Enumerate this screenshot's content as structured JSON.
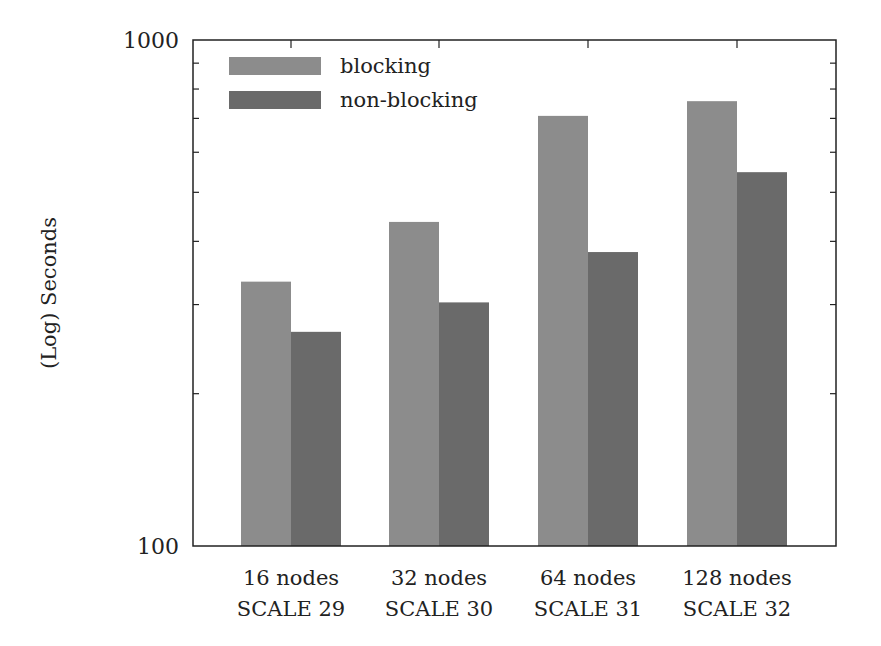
{
  "chart_data": {
    "type": "bar",
    "title": "",
    "xlabel": "",
    "ylabel": "(Log) Seconds",
    "yscale": "log",
    "ylim": [
      100,
      1000
    ],
    "yticks": [
      100,
      1000
    ],
    "ytick_labels": [
      "100",
      "1000"
    ],
    "grid": false,
    "legend_position": "upper left",
    "categories": [
      [
        "16 nodes",
        "SCALE 29"
      ],
      [
        "32 nodes",
        "SCALE 30"
      ],
      [
        "64 nodes",
        "SCALE 31"
      ],
      [
        "128 nodes",
        "SCALE 32"
      ]
    ],
    "series": [
      {
        "name": "blocking",
        "color": "#8c8c8c",
        "values": [
          333,
          437,
          708,
          757
        ]
      },
      {
        "name": "non-blocking",
        "color": "#6a6a6a",
        "values": [
          265,
          303,
          381,
          548
        ]
      }
    ]
  },
  "layout": {
    "plot": {
      "left": 193,
      "top": 40,
      "right": 836,
      "bottom": 546
    },
    "bar_width": 50,
    "group_centers": [
      291,
      439,
      588,
      737
    ]
  }
}
